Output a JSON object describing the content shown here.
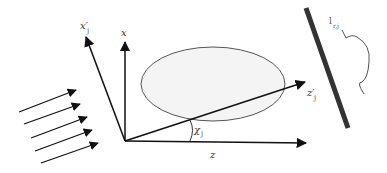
{
  "diagram": {
    "labels": {
      "x_axis": "x",
      "z_axis": "z",
      "x_prime_axis": "x′",
      "x_prime_sub": "j",
      "z_prime_axis": "z′",
      "z_prime_sub": "j",
      "angle": "χ",
      "angle_sub": "j",
      "detector_label": "l",
      "detector_sub": "r,j"
    },
    "incident_beam_arrows": 5,
    "colors": {
      "stroke": "#111111",
      "ellipse_fill": "#f4f4f4",
      "ellipse_stroke": "#555555",
      "detector_bar": "#333333",
      "bracket": "#555555"
    }
  }
}
